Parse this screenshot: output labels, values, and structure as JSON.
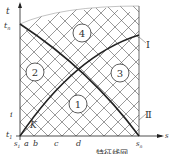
{
  "diagram": {
    "axes": {
      "x_label": "s",
      "y_label": "t",
      "y_top_label": "t",
      "y_top_sub": "n",
      "y_mid_label": "i",
      "origin_t_label": "t",
      "origin_t_sub": "1",
      "origin_s_label": "s",
      "origin_s_sub": "1",
      "x_end_label": "s",
      "x_end_sub": "n"
    },
    "x_ticks": [
      "a",
      "b",
      "c",
      "d"
    ],
    "point_label": "K",
    "regions": [
      {
        "id": "4",
        "label": "4"
      },
      {
        "id": "2",
        "label": "2"
      },
      {
        "id": "3",
        "label": "3"
      },
      {
        "id": "1",
        "label": "1"
      }
    ],
    "curves": [
      {
        "id": "I",
        "label": "Ⅰ"
      },
      {
        "id": "II",
        "label": "Ⅱ"
      }
    ],
    "caption": "特征线网"
  }
}
